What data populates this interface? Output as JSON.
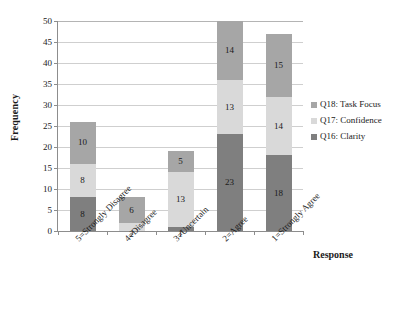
{
  "chart_data": {
    "type": "bar",
    "subtype": "stacked-bar",
    "title": "",
    "xlabel": "Response",
    "ylabel": "Frequency",
    "ylim": [
      0,
      50
    ],
    "ytick_step": 5,
    "yticks": [
      0,
      5,
      10,
      15,
      20,
      25,
      30,
      35,
      40,
      45,
      50
    ],
    "grid": "horizontal",
    "legend_position": "right",
    "categories": [
      "5=Strongly Disagree",
      "4=Disagree",
      "3=Uncertain",
      "2=Agree",
      "1=Strongly Agree"
    ],
    "series": [
      {
        "name": "Q16: Clarity",
        "color": "#7f7f7f",
        "values": [
          8,
          0,
          1,
          23,
          18
        ],
        "labels": [
          "8",
          "",
          "1",
          "23",
          "18"
        ]
      },
      {
        "name": "Q17: Confidence",
        "color": "#d9d9d9",
        "values": [
          8,
          2,
          13,
          13,
          14
        ],
        "labels": [
          "8",
          "2",
          "13",
          "13",
          "14"
        ]
      },
      {
        "name": "Q18: Task Focus",
        "color": "#a6a6a6",
        "values": [
          10,
          6,
          5,
          14,
          15
        ],
        "labels": [
          "10",
          "6",
          "5",
          "14",
          "15"
        ]
      }
    ],
    "totals": [
      26,
      8,
      19,
      50,
      47
    ]
  },
  "legend": {
    "items": [
      {
        "label": "Q18: Task Focus",
        "color": "#a6a6a6"
      },
      {
        "label": "Q17: Confidence",
        "color": "#d9d9d9"
      },
      {
        "label": "Q16: Clarity",
        "color": "#7f7f7f"
      }
    ]
  },
  "axes": {
    "y_title": "Frequency",
    "x_title": "Response"
  },
  "colors": {
    "axis": "#8d8d8d",
    "gridline": "#cfcfcf",
    "text": "#1a1a1a",
    "background": "#ffffff"
  }
}
